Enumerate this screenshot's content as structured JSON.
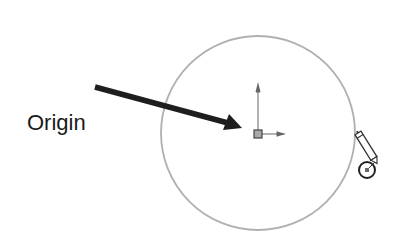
{
  "diagram": {
    "label": "Origin",
    "colors": {
      "circle": "#b0b0b0",
      "arrow": "#1e1e1e",
      "origin_marker": "#555555",
      "origin_fill": "#a8a8a8",
      "cursor": "#333333"
    },
    "elements": {
      "sketch_circle": {
        "cx": 258,
        "cy": 133,
        "r": 97
      },
      "origin_point": {
        "x": 258,
        "y": 134
      },
      "pointer_arrow": {
        "from": [
          95,
          87
        ],
        "to": [
          240,
          128
        ]
      },
      "cursor": {
        "type": "pencil-with-circle",
        "x": 366,
        "y": 168
      }
    }
  }
}
